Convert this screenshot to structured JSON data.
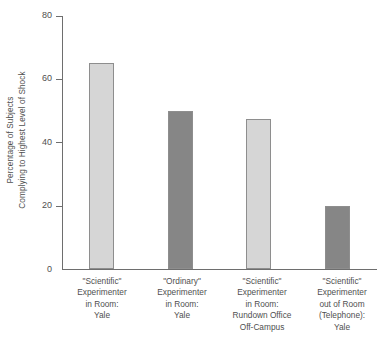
{
  "chart_data": {
    "type": "bar",
    "title": "",
    "xlabel": "",
    "ylabel": "Percentage of Subjects Complying to Highest Level of Shock",
    "ylabel_lines": [
      "Percentage of Subjects",
      "Complying to Highest Level of Shock"
    ],
    "ylim": [
      0,
      80
    ],
    "yticks": [
      0,
      20,
      40,
      60,
      80
    ],
    "ytick_labels": [
      "0",
      "20",
      "40",
      "60",
      "80"
    ],
    "grid": false,
    "legend": "none",
    "categories": [
      "\"Scientific\" Experimenter in Room: Yale",
      "\"Ordinary\" Experimenter in Room: Yale",
      "\"Scientific\" Experimenter in Room: Rundown Office Off-Campus",
      "\"Scientific\" Experimenter out of Room (Telephone): Yale"
    ],
    "category_label_lines": [
      [
        "\"Scientific\"",
        "Experimenter",
        "in Room:",
        "Yale"
      ],
      [
        "\"Ordinary\"",
        "Experimenter",
        "in Room:",
        "Yale"
      ],
      [
        "\"Scientific\"",
        "Experimenter",
        "in Room:",
        "Rundown Office",
        "Off-Campus"
      ],
      [
        "\"Scientific\"",
        "Experimenter",
        "out of Room",
        "(Telephone):",
        "Yale"
      ]
    ],
    "values": [
      65,
      50,
      47.5,
      20
    ],
    "bar_colors": [
      "#d6d6d6",
      "#868686",
      "#d6d6d6",
      "#868686"
    ],
    "bar_border_color": "#8e8e8e",
    "axis_color": "#6e6e6e",
    "text_color": "#4f4f4f",
    "background": "#ffffff"
  }
}
